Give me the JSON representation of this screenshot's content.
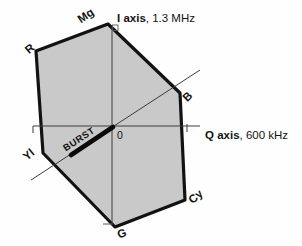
{
  "figure": {
    "axes": {
      "i": {
        "label": "I axis",
        "spec": ", 1.3 MHz"
      },
      "q": {
        "label": "Q axis",
        "spec": ", 600 kHz"
      }
    },
    "origin": "0",
    "burst": "BURST",
    "vertices": {
      "mg": "Mg",
      "r": "R",
      "yl": "Yl",
      "g": "G",
      "cy": "Cy",
      "b": "B"
    },
    "colors": {
      "hexagon_fill": "#c9c9c9",
      "outline": "#121212",
      "axis_line": "#3c3c3c",
      "burst_vector": "#0a0a0a"
    }
  }
}
